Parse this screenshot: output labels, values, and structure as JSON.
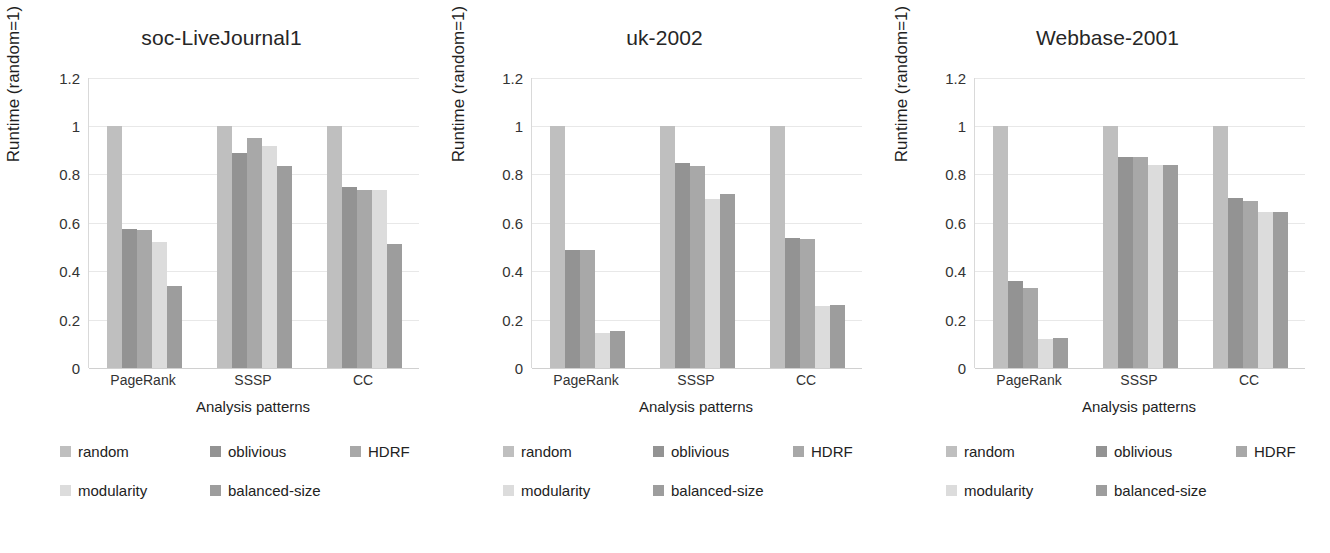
{
  "chart_data": [
    {
      "type": "bar",
      "title": "soc-LiveJournal1",
      "xlabel": "Analysis patterns",
      "ylabel": "Runtime (random=1)",
      "categories": [
        "PageRank",
        "SSSP",
        "CC"
      ],
      "ylim": [
        0,
        1.2
      ],
      "yticks": [
        "1.2",
        "1",
        "0.8",
        "0.6",
        "0.4",
        "0.2",
        "0"
      ],
      "ytick_values": [
        1.2,
        1,
        0.8,
        0.6,
        0.4,
        0.2,
        0
      ],
      "grid": true,
      "legend_position": "bottom-left",
      "series": [
        {
          "name": "random",
          "values": [
            1.0,
            1.0,
            1.0
          ]
        },
        {
          "name": "oblivious",
          "values": [
            0.575,
            0.89,
            0.75
          ]
        },
        {
          "name": "HDRF",
          "values": [
            0.57,
            0.95,
            0.735
          ]
        },
        {
          "name": "modularity",
          "values": [
            0.52,
            0.92,
            0.735
          ]
        },
        {
          "name": "balanced-size",
          "values": [
            0.34,
            0.835,
            0.515
          ]
        }
      ]
    },
    {
      "type": "bar",
      "title": "uk-2002",
      "xlabel": "Analysis patterns",
      "ylabel": "Runtime (random=1)",
      "categories": [
        "PageRank",
        "SSSP",
        "CC"
      ],
      "ylim": [
        0,
        1.2
      ],
      "yticks": [
        "1.2",
        "1",
        "0.8",
        "0.6",
        "0.4",
        "0.2",
        "0"
      ],
      "ytick_values": [
        1.2,
        1,
        0.8,
        0.6,
        0.4,
        0.2,
        0
      ],
      "grid": true,
      "legend_position": "bottom-left",
      "series": [
        {
          "name": "random",
          "values": [
            1.0,
            1.0,
            1.0
          ]
        },
        {
          "name": "oblivious",
          "values": [
            0.49,
            0.85,
            0.54
          ]
        },
        {
          "name": "HDRF",
          "values": [
            0.49,
            0.835,
            0.535
          ]
        },
        {
          "name": "modularity",
          "values": [
            0.145,
            0.7,
            0.255
          ]
        },
        {
          "name": "balanced-size",
          "values": [
            0.155,
            0.72,
            0.26
          ]
        }
      ]
    },
    {
      "type": "bar",
      "title": "Webbase-2001",
      "xlabel": "Analysis patterns",
      "ylabel": "Runtime (random=1)",
      "categories": [
        "PageRank",
        "SSSP",
        "CC"
      ],
      "ylim": [
        0,
        1.2
      ],
      "yticks": [
        "1.2",
        "1",
        "0.8",
        "0.6",
        "0.4",
        "0.2",
        "0"
      ],
      "ytick_values": [
        1.2,
        1,
        0.8,
        0.6,
        0.4,
        0.2,
        0
      ],
      "grid": true,
      "legend_position": "bottom-left",
      "series": [
        {
          "name": "random",
          "values": [
            1.0,
            1.0,
            1.0
          ]
        },
        {
          "name": "oblivious",
          "values": [
            0.36,
            0.875,
            0.705
          ]
        },
        {
          "name": "HDRF",
          "values": [
            0.33,
            0.875,
            0.69
          ]
        },
        {
          "name": "modularity",
          "values": [
            0.12,
            0.84,
            0.645
          ]
        },
        {
          "name": "balanced-size",
          "values": [
            0.125,
            0.84,
            0.645
          ]
        }
      ]
    }
  ],
  "series_colors": {
    "random": "#bfbfbf",
    "oblivious": "#939393",
    "HDRF": "#a8a8a8",
    "modularity": "#dcdcdc",
    "balanced-size": "#9d9d9d"
  },
  "panels": [
    {
      "title": "soc-LiveJournal1",
      "ylabel": "Runtime (random=1)",
      "xlabel": "Analysis patterns",
      "yticks": [
        "1.2",
        "1",
        "0.8",
        "0.6",
        "0.4",
        "0.2",
        "0"
      ],
      "xticks": [
        "PageRank",
        "SSSP",
        "CC"
      ],
      "legend": [
        "random",
        "oblivious",
        "HDRF",
        "modularity",
        "balanced-size"
      ]
    },
    {
      "title": "uk-2002",
      "ylabel": "Runtime (random=1)",
      "xlabel": "Analysis patterns",
      "yticks": [
        "1.2",
        "1",
        "0.8",
        "0.6",
        "0.4",
        "0.2",
        "0"
      ],
      "xticks": [
        "PageRank",
        "SSSP",
        "CC"
      ],
      "legend": [
        "random",
        "oblivious",
        "HDRF",
        "modularity",
        "balanced-size"
      ]
    },
    {
      "title": "Webbase-2001",
      "ylabel": "Runtime (random=1)",
      "xlabel": "Analysis patterns",
      "yticks": [
        "1.2",
        "1",
        "0.8",
        "0.6",
        "0.4",
        "0.2",
        "0"
      ],
      "xticks": [
        "PageRank",
        "SSSP",
        "CC"
      ],
      "legend": [
        "random",
        "oblivious",
        "HDRF",
        "modularity",
        "balanced-size"
      ]
    }
  ]
}
